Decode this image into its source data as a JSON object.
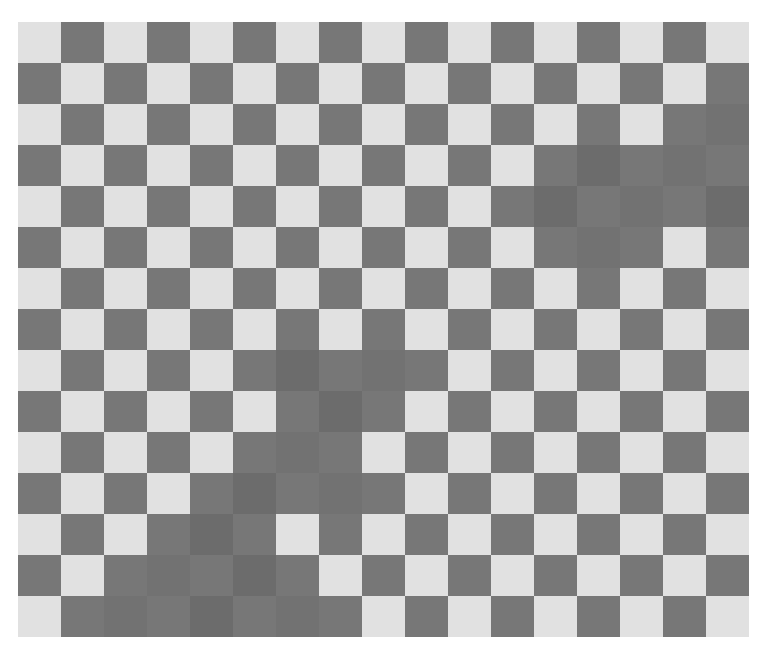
{
  "board": {
    "rows": 15,
    "cols": 17,
    "colors": {
      "light": "#e1e1e1",
      "dark": "#777777",
      "flipped": "#727272",
      "flipped_alt": "#6c6c6c",
      "background": "#ffffff"
    },
    "pattern": "checkerboard, top-left light",
    "flipped_cells": [
      [
        2,
        16
      ],
      [
        3,
        13
      ],
      [
        3,
        15
      ],
      [
        4,
        12
      ],
      [
        4,
        14
      ],
      [
        4,
        16
      ],
      [
        5,
        13
      ],
      [
        8,
        6
      ],
      [
        8,
        8
      ],
      [
        9,
        7
      ],
      [
        10,
        6
      ],
      [
        11,
        5
      ],
      [
        11,
        7
      ],
      [
        12,
        4
      ],
      [
        13,
        3
      ],
      [
        13,
        5
      ],
      [
        14,
        2
      ],
      [
        14,
        4
      ],
      [
        14,
        6
      ]
    ]
  }
}
